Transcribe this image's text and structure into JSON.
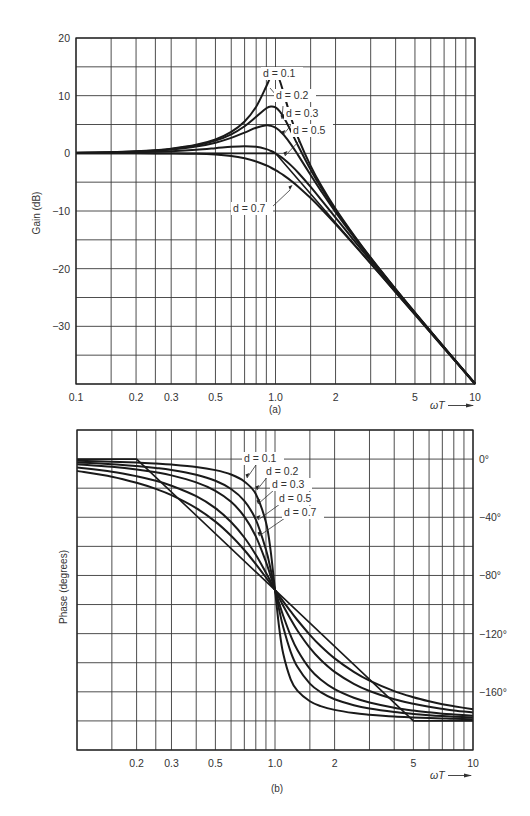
{
  "chart_data": [
    {
      "type": "line",
      "panel": "a",
      "caption": "(a)",
      "title": "",
      "xlabel": "ωT",
      "ylabel": "Gain (dB)",
      "xscale": "log",
      "xlim": [
        0.1,
        10
      ],
      "ylim": [
        -40,
        20
      ],
      "grid": true,
      "x_tick_labels": [
        "0.1",
        "0.2",
        "0.3",
        "0.5",
        "1.0",
        "2",
        "5",
        "10"
      ],
      "x_tick_values": [
        0.1,
        0.2,
        0.3,
        0.5,
        1.0,
        2,
        5,
        10
      ],
      "x_grid_values": [
        0.1,
        0.15,
        0.2,
        0.25,
        0.3,
        0.4,
        0.5,
        0.6,
        0.7,
        0.8,
        0.9,
        1.0,
        1.5,
        2,
        3,
        4,
        5,
        6,
        7,
        8,
        9,
        10
      ],
      "y_tick_labels": [
        "20",
        "10",
        "0",
        "−10",
        "−20",
        "−30"
      ],
      "y_tick_values": [
        20,
        10,
        0,
        -10,
        -20,
        -30
      ],
      "y_grid_values": [
        20,
        15,
        10,
        5,
        0,
        -5,
        -10,
        -15,
        -20,
        -25,
        -30,
        -35,
        -40
      ],
      "x": [
        0.1,
        0.15,
        0.2,
        0.25,
        0.3,
        0.4,
        0.5,
        0.6,
        0.7,
        0.8,
        0.9,
        0.95,
        1.0,
        1.05,
        1.1,
        1.2,
        1.3,
        1.5,
        1.7,
        2,
        2.5,
        3,
        4,
        5,
        6,
        7,
        8,
        10
      ],
      "series": [
        {
          "name": "d = 0.1",
          "values": [
            0.09,
            0.19,
            0.35,
            0.55,
            0.8,
            1.48,
            2.42,
            3.73,
            5.53,
            8.09,
            11.64,
            13.41,
            13.98,
            12.63,
            10.34,
            6.0,
            2.65,
            -2.18,
            -5.67,
            -9.62,
            -14.44,
            -18.09,
            -23.53,
            -27.61,
            -30.89,
            -33.63,
            -35.99,
            -39.91
          ]
        },
        {
          "name": "d = 0.2",
          "values": [
            0.08,
            0.18,
            0.33,
            0.51,
            0.75,
            1.36,
            2.2,
            3.3,
            4.7,
            6.34,
            7.81,
            8.13,
            7.96,
            7.28,
            6.24,
            3.73,
            1.27,
            -2.84,
            -6.06,
            -9.84,
            -14.56,
            -18.16,
            -23.57,
            -27.63,
            -30.9,
            -33.64,
            -36.0,
            -39.92
          ]
        },
        {
          "name": "d = 0.3",
          "values": [
            0.07,
            0.16,
            0.29,
            0.45,
            0.65,
            1.17,
            1.85,
            2.68,
            3.6,
            4.44,
            4.85,
            4.76,
            4.44,
            3.9,
            3.19,
            1.48,
            -0.35,
            -3.75,
            -6.64,
            -10.19,
            -14.74,
            -18.28,
            -23.63,
            -27.67,
            -30.93,
            -33.66,
            -36.01,
            -39.93
          ]
        },
        {
          "name": "d = 0.5",
          "values": [
            0.04,
            0.1,
            0.17,
            0.26,
            0.37,
            0.63,
            0.9,
            1.14,
            1.25,
            1.14,
            0.73,
            0.4,
            0.0,
            -0.47,
            -0.98,
            -2.13,
            -3.36,
            -5.81,
            -8.1,
            -11.14,
            -15.29,
            -18.63,
            -23.82,
            -27.79,
            -31.01,
            -33.72,
            -36.06,
            -39.96
          ]
        },
        {
          "name": "d = 0.7",
          "values": [
            0.0,
            0.0,
            0.0,
            -0.01,
            -0.02,
            -0.08,
            -0.22,
            -0.47,
            -0.87,
            -1.41,
            -2.1,
            -2.5,
            -2.92,
            -3.37,
            -3.83,
            -4.79,
            -5.78,
            -7.76,
            -9.65,
            -12.26,
            -16.0,
            -19.12,
            -24.09,
            -27.96,
            -31.12,
            -33.8,
            -36.12,
            -40.0
          ]
        }
      ],
      "asymptote": {
        "x": [
          0.1,
          1.0,
          10
        ],
        "values": [
          0,
          0,
          -40
        ]
      },
      "legend_labels": [
        "d = 0.1",
        "d = 0.2",
        "d = 0.3",
        "d = 0.5",
        "d = 0.7"
      ],
      "legend_placement": "annotations near peaks (center-right)"
    },
    {
      "type": "line",
      "panel": "b",
      "caption": "(b)",
      "title": "",
      "xlabel": "ωT",
      "ylabel": "Phase (degrees)",
      "xscale": "log",
      "xlim": [
        0.1,
        10
      ],
      "ylim": [
        -200,
        20
      ],
      "grid": true,
      "x_tick_labels": [
        "0.2",
        "0.3",
        "0.5",
        "1.0",
        "2",
        "5",
        "10"
      ],
      "x_tick_values": [
        0.2,
        0.3,
        0.5,
        1.0,
        2,
        5,
        10
      ],
      "x_grid_values": [
        0.1,
        0.15,
        0.2,
        0.25,
        0.3,
        0.4,
        0.5,
        0.6,
        0.7,
        0.8,
        0.9,
        1.0,
        1.5,
        2,
        3,
        4,
        5,
        6,
        7,
        8,
        9,
        10
      ],
      "y_tick_labels": [
        "0°",
        "−40°",
        "−80°",
        "−120°",
        "−160°"
      ],
      "y_tick_values": [
        0,
        -40,
        -80,
        -120,
        -160
      ],
      "y_axis_side": "right",
      "y_grid_values": [
        20,
        0,
        -20,
        -40,
        -60,
        -80,
        -100,
        -120,
        -140,
        -160,
        -180,
        -200
      ],
      "x": [
        0.1,
        0.15,
        0.2,
        0.25,
        0.3,
        0.4,
        0.5,
        0.6,
        0.7,
        0.8,
        0.9,
        0.95,
        1.0,
        1.05,
        1.1,
        1.2,
        1.3,
        1.5,
        1.7,
        2,
        2.5,
        3,
        4,
        5,
        6,
        7,
        8,
        10
      ],
      "series": [
        {
          "name": "d = 0.1",
          "values": [
            -1.2,
            -1.8,
            -2.4,
            -3.1,
            -3.8,
            -5.4,
            -7.6,
            -10.6,
            -15.4,
            -24.0,
            -43.5,
            -62.8,
            -90,
            -116.0,
            -133.7,
            -151.4,
            -159.4,
            -166.5,
            -169.8,
            -172.4,
            -174.6,
            -175.7,
            -177.0,
            -177.6,
            -178.0,
            -178.3,
            -178.6,
            -178.8
          ]
        },
        {
          "name": "d = 0.2",
          "values": [
            -2.3,
            -3.5,
            -4.8,
            -6.1,
            -7.5,
            -10.8,
            -14.9,
            -20.6,
            -28.8,
            -41.6,
            -62.2,
            -75.6,
            -90,
            -103.7,
            -115.5,
            -132.5,
            -143.0,
            -154.4,
            -160.2,
            -165.1,
            -169.2,
            -171.5,
            -173.9,
            -175.2,
            -176.1,
            -176.7,
            -177.1,
            -177.7
          ]
        },
        {
          "name": "d = 0.3",
          "values": [
            -3.5,
            -5.3,
            -7.1,
            -9.1,
            -11.2,
            -16.0,
            -21.8,
            -29.4,
            -39.5,
            -53.1,
            -70.6,
            -80.3,
            -90,
            -99.2,
            -107.7,
            -121.4,
            -131.5,
            -144.3,
            -151.6,
            -158.2,
            -164.1,
            -167.3,
            -170.9,
            -172.9,
            -174.1,
            -175.0,
            -175.6,
            -176.5
          ]
        },
        {
          "name": "d = 0.5",
          "values": [
            -5.8,
            -8.7,
            -11.8,
            -14.9,
            -18.3,
            -25.5,
            -33.7,
            -43.2,
            -53.9,
            -65.8,
            -78.1,
            -84.1,
            -90,
            -95.6,
            -100.8,
            -110.1,
            -118.0,
            -129.8,
            -138.0,
            -146.3,
            -154.5,
            -159.4,
            -165.1,
            -168.2,
            -170.3,
            -171.7,
            -172.8,
            -174.2
          ]
        },
        {
          "name": "d = 0.7",
          "values": [
            -8.1,
            -12.1,
            -16.3,
            -20.5,
            -24.8,
            -33.7,
            -43.0,
            -52.7,
            -62.5,
            -72.2,
            -81.4,
            -85.8,
            -90,
            -94.0,
            -97.8,
            -104.7,
            -110.8,
            -120.8,
            -128.5,
            -137.0,
            -146.3,
            -152.3,
            -159.5,
            -163.7,
            -166.5,
            -168.5,
            -169.9,
            -172.0
          ]
        }
      ],
      "asymptote": {
        "x": [
          0.1,
          0.2,
          5,
          10
        ],
        "values": [
          0,
          0,
          -180,
          -180
        ]
      },
      "legend_labels": [
        "d = 0.1",
        "d = 0.2",
        "d = 0.3",
        "d = 0.5",
        "d = 0.7"
      ],
      "legend_placement": "annotations top-center"
    }
  ]
}
